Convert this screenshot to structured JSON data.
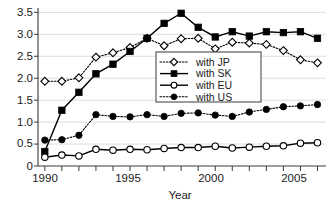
{
  "chart_data": {
    "type": "line",
    "title": "",
    "xlabel": "Year",
    "ylabel": "",
    "x": [
      1990,
      1991,
      1992,
      1993,
      1994,
      1995,
      1996,
      1997,
      1998,
      1999,
      2000,
      2001,
      2002,
      2003,
      2004,
      2005,
      2006
    ],
    "xlim": [
      1989.6,
      2006.5
    ],
    "ylim": [
      0,
      3.6
    ],
    "xticks": [
      1990,
      1991,
      1992,
      1993,
      1994,
      1995,
      1996,
      1997,
      1998,
      1999,
      2000,
      2001,
      2002,
      2003,
      2004,
      2005,
      2006
    ],
    "xtick_labels": [
      "1990",
      "",
      "",
      "",
      "",
      "1995",
      "",
      "",
      "",
      "",
      "2000",
      "",
      "",
      "",
      "",
      "2005",
      ""
    ],
    "yticks": [
      0,
      0.5,
      1.0,
      1.5,
      2.0,
      2.5,
      3.0,
      3.5
    ],
    "ytick_labels": [
      "0",
      "0.5",
      "1.0",
      "1.5",
      "2.0",
      "2.5",
      "3.0",
      "3.5"
    ],
    "grid": true,
    "grid_axis": "y",
    "legend_position": "center",
    "series": [
      {
        "name": "with JP",
        "marker": "open-diamond",
        "linestyle": "dotted",
        "color": "#000000",
        "values": [
          1.93,
          1.93,
          2.01,
          2.48,
          2.58,
          2.7,
          2.91,
          2.74,
          2.9,
          2.91,
          2.67,
          2.82,
          2.8,
          2.77,
          2.63,
          2.42,
          2.35
        ]
      },
      {
        "name": "with SK",
        "marker": "filled-square",
        "linestyle": "solid",
        "color": "#000000",
        "values": [
          0.33,
          1.27,
          1.68,
          2.1,
          2.32,
          2.61,
          2.91,
          3.25,
          3.48,
          3.16,
          2.94,
          3.06,
          2.96,
          3.06,
          3.04,
          3.06,
          2.91
        ]
      },
      {
        "name": "with EU",
        "marker": "open-circle",
        "linestyle": "solid",
        "color": "#000000",
        "values": [
          0.2,
          0.25,
          0.23,
          0.38,
          0.36,
          0.38,
          0.37,
          0.4,
          0.42,
          0.42,
          0.45,
          0.41,
          0.43,
          0.45,
          0.46,
          0.52,
          0.53
        ]
      },
      {
        "name": "with US",
        "marker": "filled-circle",
        "linestyle": "dotted",
        "color": "#000000",
        "values": [
          0.59,
          0.6,
          0.7,
          1.17,
          1.13,
          1.12,
          1.17,
          1.13,
          1.2,
          1.21,
          1.16,
          1.13,
          1.23,
          1.29,
          1.35,
          1.37,
          1.4
        ]
      }
    ]
  },
  "legend": {
    "entries": [
      {
        "label": "with JP"
      },
      {
        "label": "with SK"
      },
      {
        "label": "with EU"
      },
      {
        "label": "with US"
      }
    ]
  },
  "axes": {
    "x_title": "Year",
    "y_tick_0": "0",
    "y_tick_1": "0.5",
    "y_tick_2": "1.0",
    "y_tick_3": "1.5",
    "y_tick_4": "2.0",
    "y_tick_5": "2.5",
    "y_tick_6": "3.0",
    "y_tick_7": "3.5",
    "x_tick_0": "1990",
    "x_tick_1": "1995",
    "x_tick_2": "2000",
    "x_tick_3": "2005"
  }
}
